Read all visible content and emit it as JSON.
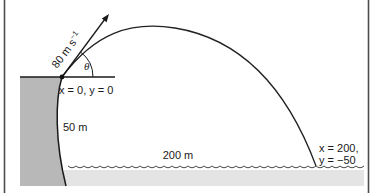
{
  "figure": {
    "velocity": {
      "base": "80 m s",
      "exponent": "−1"
    },
    "angle": "θ",
    "origin": "x = 0, y = 0",
    "cliff_height": "50 m",
    "range": "200 m",
    "impact_line1": "x = 200,",
    "impact_line2": "y = −50"
  },
  "colors": {
    "cliff_fill": "#b8b8b8",
    "water_fill": "#e4e4e4",
    "line": "#1a1a1a",
    "border": "#4d4d4d"
  }
}
